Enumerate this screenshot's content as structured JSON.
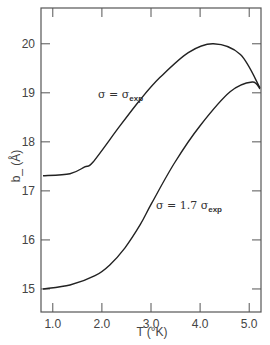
{
  "chart_data": {
    "type": "line",
    "title": "",
    "xlabel": "T (°K)",
    "ylabel": "b_ (Å)",
    "xlim": [
      0.76,
      5.24
    ],
    "ylim": [
      14.53,
      20.73
    ],
    "x_ticks": [
      1.0,
      2.0,
      3.0,
      4.0,
      5.0
    ],
    "x_tick_labels": [
      "1.0",
      "2.0",
      "3.0",
      "4.0",
      "5.0"
    ],
    "y_ticks": [
      15,
      16,
      17,
      18,
      19,
      20
    ],
    "y_tick_labels": [
      "15",
      "16",
      "17",
      "18",
      "19",
      "20"
    ],
    "grid": false,
    "legend": "inline annotations",
    "series": [
      {
        "name": "σ = σ_exp",
        "label_main": "σ = σ",
        "label_sub": "exp",
        "x": [
          0.8,
          1.35,
          1.65,
          1.82,
          2.37,
          2.78,
          3.18,
          3.76,
          4.27,
          4.82,
          5.22
        ],
        "y": [
          17.31,
          17.35,
          17.49,
          17.59,
          18.33,
          18.86,
          19.31,
          19.82,
          20.0,
          19.78,
          19.1
        ]
      },
      {
        "name": "σ = 1.7 σ_exp",
        "label_main": "σ = 1.7 σ",
        "label_sub": "exp",
        "x": [
          0.8,
          1.35,
          1.86,
          2.16,
          2.47,
          2.78,
          3.02,
          3.49,
          4.0,
          4.61,
          5.06,
          5.22
        ],
        "y": [
          15.0,
          15.08,
          15.27,
          15.49,
          15.84,
          16.31,
          16.76,
          17.59,
          18.33,
          19.02,
          19.22,
          19.08
        ]
      }
    ]
  }
}
